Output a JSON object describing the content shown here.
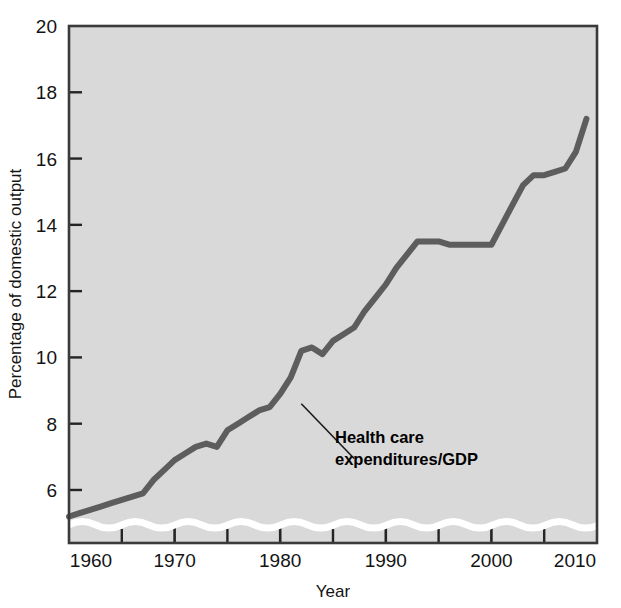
{
  "figure": {
    "name": "health-care-expenditures-gdp-chart",
    "background_color": "#ffffff",
    "plot_background_color": "#d9d9d9",
    "frame_color": "#3a3a3a"
  },
  "chart_data": {
    "type": "line",
    "title": "",
    "subtitle": "",
    "xlabel": "Year",
    "ylabel": "Percentage of domestic output",
    "xlim": [
      1960,
      2010
    ],
    "ylim": [
      4.4,
      20
    ],
    "grid": false,
    "legend_position": "none",
    "x_major_ticks": [
      1960,
      1970,
      1980,
      1990,
      2000,
      2010
    ],
    "x_minor_ticks": [
      1965,
      1975,
      1985,
      1995,
      2005
    ],
    "x_tick_labels": [
      "1960",
      "1970",
      "1980",
      "1990",
      "2000",
      "2010"
    ],
    "y_ticks": [
      6,
      8,
      10,
      12,
      14,
      16,
      18,
      20
    ],
    "y_tick_labels": [
      "6",
      "8",
      "10",
      "12",
      "14",
      "16",
      "18",
      "20"
    ],
    "axis_break": {
      "present": true,
      "style": "white-wave",
      "value": 4.95,
      "color": "#ffffff"
    },
    "series": [
      {
        "name": "Health care expenditures/GDP",
        "color": "#5d5d5d",
        "line_width": 6,
        "x": [
          1960,
          1961,
          1962,
          1963,
          1964,
          1965,
          1966,
          1967,
          1968,
          1969,
          1970,
          1971,
          1972,
          1973,
          1974,
          1975,
          1976,
          1977,
          1978,
          1979,
          1980,
          1981,
          1982,
          1983,
          1984,
          1985,
          1986,
          1987,
          1988,
          1989,
          1990,
          1991,
          1992,
          1993,
          1994,
          1995,
          1996,
          1997,
          1998,
          1999,
          2000,
          2001,
          2002,
          2003,
          2004,
          2005,
          2006,
          2007,
          2008,
          2009
        ],
        "y": [
          5.2,
          5.3,
          5.4,
          5.5,
          5.6,
          5.7,
          5.8,
          5.9,
          6.3,
          6.6,
          6.9,
          7.1,
          7.3,
          7.4,
          7.3,
          7.8,
          8.0,
          8.2,
          8.4,
          8.5,
          8.9,
          9.4,
          10.2,
          10.3,
          10.1,
          10.5,
          10.7,
          10.9,
          11.4,
          11.8,
          12.2,
          12.7,
          13.1,
          13.5,
          13.5,
          13.5,
          13.4,
          13.4,
          13.4,
          13.4,
          13.4,
          14.0,
          14.6,
          15.2,
          15.5,
          15.5,
          15.6,
          15.7,
          16.2,
          17.2
        ],
        "annotation": {
          "label_lines": [
            "Health care",
            "expenditures/GDP"
          ],
          "leader_from_x": 1982,
          "leader_from_y": 8.6,
          "leader_to_x": 1987,
          "leader_to_y": 6.95
        }
      }
    ]
  }
}
